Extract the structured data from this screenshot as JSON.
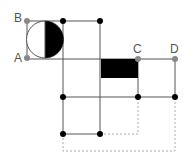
{
  "diagram": {
    "labels": {
      "A": "A",
      "B": "B",
      "C": "C",
      "D": "D"
    },
    "colors": {
      "line": "#555555",
      "dashed": "#aaaaaa",
      "dot": "#000000",
      "label_dot": "#888888",
      "fill": "#000000"
    },
    "points": {
      "A": [
        27,
        58
      ],
      "B": [
        27,
        21
      ],
      "C": [
        138,
        59
      ],
      "D": [
        175,
        59
      ]
    },
    "black_dots": [
      [
        63,
        21
      ],
      [
        100,
        21
      ],
      [
        63,
        97
      ],
      [
        138,
        97
      ],
      [
        175,
        97
      ],
      [
        63,
        134
      ],
      [
        100,
        134
      ]
    ],
    "shapes": {
      "semicircle": "circle centered (45,39) r=18, right half filled black",
      "black_rectangle": "x 101-138, y 59-78"
    }
  }
}
